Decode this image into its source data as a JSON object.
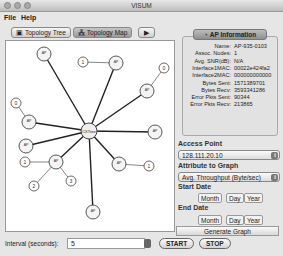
{
  "window": {
    "title": "VISUM"
  },
  "menu": [
    {
      "label": "File"
    },
    {
      "label": "Help"
    }
  ],
  "tabs": [
    {
      "label": "Topology Tree",
      "icon": "monitor-icon",
      "selected": false
    },
    {
      "label": "Topology Map",
      "icon": "map-icon",
      "selected": true
    }
  ],
  "tab_more": "▶",
  "ap_info": {
    "header": "AP Information",
    "rows": [
      {
        "k": "Name:",
        "v": "AP-935-0103"
      },
      {
        "k": "Assoc. Nodes:",
        "v": "1"
      },
      {
        "k": "Avg. SNR(dB):",
        "v": "N/A"
      },
      {
        "k": "Interface1MAC:",
        "v": "00022e424fa2"
      },
      {
        "k": "Interface2MAC:",
        "v": "000000000000"
      },
      {
        "k": "Bytes Sent:",
        "v": "1571389701"
      },
      {
        "k": "Bytes Recv:",
        "v": "3593341286"
      },
      {
        "k": "Error Pkts Sent:",
        "v": "90344"
      },
      {
        "k": "Error Pkts Recv:",
        "v": "213865"
      }
    ]
  },
  "access_point": {
    "label": "Access Point",
    "value": "128.111.20.10"
  },
  "attribute": {
    "label": "Attribute to Graph",
    "value": "Avg. Throughput (Byte/sec)"
  },
  "start_date": {
    "label": "Start Date",
    "month": "Month",
    "day": "Day",
    "year": "Year"
  },
  "end_date": {
    "label": "End Date",
    "month": "Month",
    "day": "Day",
    "year": "Year"
  },
  "generate": "Generate Graph",
  "interval": {
    "label": "Interval (seconds):",
    "value": "5"
  },
  "start_btn": "START",
  "stop_btn": "STOP",
  "topology": {
    "center": {
      "label": "CXTree",
      "x": 83,
      "y": 90
    },
    "aps": [
      {
        "label": "AP",
        "x": 38,
        "y": 13,
        "leaves": []
      },
      {
        "label": "AP",
        "x": 110,
        "y": 22,
        "leaves": [
          {
            "label": "1",
            "x": 77,
            "y": 21
          }
        ]
      },
      {
        "label": "AP",
        "x": 141,
        "y": 50,
        "leaves": [
          {
            "label": "0",
            "x": 158,
            "y": 27
          }
        ]
      },
      {
        "label": "AP",
        "x": 23,
        "y": 81,
        "leaves": [
          {
            "label": "0",
            "x": 10,
            "y": 62
          }
        ]
      },
      {
        "label": "AP",
        "x": 149,
        "y": 91,
        "leaves": []
      },
      {
        "label": "AP",
        "x": 20,
        "y": 105,
        "leaves": []
      },
      {
        "label": "AP",
        "x": 50,
        "y": 121,
        "leaves": [
          {
            "label": "1",
            "x": 19,
            "y": 121
          },
          {
            "label": "2",
            "x": 28,
            "y": 145
          },
          {
            "label": "3",
            "x": 65,
            "y": 140
          }
        ]
      },
      {
        "label": "AP",
        "x": 113,
        "y": 123,
        "leaves": [
          {
            "label": "1",
            "x": 143,
            "y": 125
          }
        ]
      },
      {
        "label": "AP",
        "x": 87,
        "y": 171,
        "leaves": []
      }
    ]
  }
}
